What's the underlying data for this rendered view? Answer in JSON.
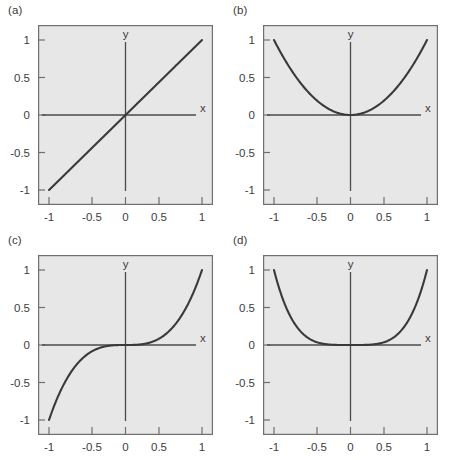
{
  "figure": {
    "background_color": "#ffffff",
    "panel_fill_color": "#e7e7e7",
    "frame_color": "#6f6f6f",
    "curve_color": "#3a3a3a",
    "axis_color": "#4a4a4a"
  },
  "panels": [
    {
      "label": "(a)",
      "x_axis_name": "x",
      "y_axis_name": "y",
      "x_ticks": [
        "-1",
        "-0.5",
        "0",
        "0.5",
        "1"
      ],
      "y_ticks": [
        "1",
        "0.5",
        "0",
        "-0.5",
        "-1"
      ]
    },
    {
      "label": "(b)",
      "x_axis_name": "x",
      "y_axis_name": "y",
      "x_ticks": [
        "-1",
        "-0.5",
        "0",
        "0.5",
        "1"
      ],
      "y_ticks": [
        "1",
        "0.5",
        "0",
        "-0.5",
        "-1"
      ]
    },
    {
      "label": "(c)",
      "x_axis_name": "x",
      "y_axis_name": "y",
      "x_ticks": [
        "-1",
        "-0.5",
        "0",
        "0.5",
        "1"
      ],
      "y_ticks": [
        "1",
        "0.5",
        "0",
        "-0.5",
        "-1"
      ]
    },
    {
      "label": "(d)",
      "x_axis_name": "x",
      "y_axis_name": "y",
      "x_ticks": [
        "-1",
        "-0.5",
        "0",
        "0.5",
        "1"
      ],
      "y_ticks": [
        "1",
        "0.5",
        "0",
        "-0.5",
        "-1"
      ]
    }
  ],
  "chart_data": [
    {
      "type": "line",
      "panel": "(a)",
      "title": "",
      "xlabel": "x",
      "ylabel": "y",
      "xlim": [
        -1,
        1
      ],
      "ylim": [
        -1,
        1
      ],
      "xticks": [
        -1,
        -0.5,
        0,
        0.5,
        1
      ],
      "yticks": [
        -1,
        -0.5,
        0,
        0.5,
        1
      ],
      "grid": false,
      "legend": "none",
      "series": [
        {
          "name": "y = x",
          "x": [
            -1,
            -0.75,
            -0.5,
            -0.25,
            0,
            0.25,
            0.5,
            0.75,
            1
          ],
          "values": [
            -1,
            -0.75,
            -0.5,
            -0.25,
            0,
            0.25,
            0.5,
            0.75,
            1
          ]
        }
      ]
    },
    {
      "type": "line",
      "panel": "(b)",
      "title": "",
      "xlabel": "x",
      "ylabel": "y",
      "xlim": [
        -1,
        1
      ],
      "ylim": [
        -1,
        1
      ],
      "xticks": [
        -1,
        -0.5,
        0,
        0.5,
        1
      ],
      "yticks": [
        -1,
        -0.5,
        0,
        0.5,
        1
      ],
      "grid": false,
      "legend": "none",
      "series": [
        {
          "name": "y = x^2",
          "x": [
            -1,
            -0.75,
            -0.5,
            -0.25,
            0,
            0.25,
            0.5,
            0.75,
            1
          ],
          "values": [
            1,
            0.5625,
            0.25,
            0.0625,
            0,
            0.0625,
            0.25,
            0.5625,
            1
          ]
        }
      ]
    },
    {
      "type": "line",
      "panel": "(c)",
      "title": "",
      "xlabel": "x",
      "ylabel": "y",
      "xlim": [
        -1,
        1
      ],
      "ylim": [
        -1,
        1
      ],
      "xticks": [
        -1,
        -0.5,
        0,
        0.5,
        1
      ],
      "yticks": [
        -1,
        -0.5,
        0,
        0.5,
        1
      ],
      "grid": false,
      "legend": "none",
      "series": [
        {
          "name": "y = x^3",
          "x": [
            -1,
            -0.75,
            -0.5,
            -0.25,
            0,
            0.25,
            0.5,
            0.75,
            1
          ],
          "values": [
            -1,
            -0.4219,
            -0.125,
            -0.0156,
            0,
            0.0156,
            0.125,
            0.4219,
            1
          ]
        }
      ]
    },
    {
      "type": "line",
      "panel": "(d)",
      "title": "",
      "xlabel": "x",
      "ylabel": "y",
      "xlim": [
        -1,
        1
      ],
      "ylim": [
        -1,
        1
      ],
      "xticks": [
        -1,
        -0.5,
        0,
        0.5,
        1
      ],
      "yticks": [
        -1,
        -0.5,
        0,
        0.5,
        1
      ],
      "grid": false,
      "legend": "none",
      "series": [
        {
          "name": "y = x^4",
          "x": [
            -1,
            -0.75,
            -0.5,
            -0.25,
            0,
            0.25,
            0.5,
            0.75,
            1
          ],
          "values": [
            1,
            0.3164,
            0.0625,
            0.0039,
            0,
            0.0039,
            0.0625,
            0.3164,
            1
          ]
        }
      ]
    }
  ]
}
